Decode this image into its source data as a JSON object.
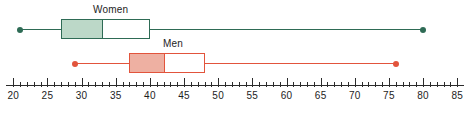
{
  "chart_data": {
    "type": "box",
    "title": "",
    "xlabel": "",
    "ylabel": "",
    "orientation": "horizontal",
    "xlim": [
      20,
      85
    ],
    "xticks": [
      20,
      25,
      30,
      35,
      40,
      45,
      50,
      55,
      60,
      65,
      70,
      75,
      80,
      85
    ],
    "xtick_labels": [
      "20",
      "25",
      "30",
      "35",
      "40",
      "45",
      "50",
      "55",
      "60",
      "65",
      "70",
      "75",
      "80",
      "85"
    ],
    "minor_tick_step": 1,
    "grid": false,
    "legend": "inline-labels",
    "series": [
      {
        "name": "Women",
        "label": "Women",
        "color": "#2e6b55",
        "fill": "#bcd8c8",
        "min": 21,
        "q1": 27,
        "median": 33,
        "q3": 40,
        "max": 80
      },
      {
        "name": "Men",
        "label": "Men",
        "color": "#e2543c",
        "fill": "#eeb0a2",
        "min": 29,
        "q1": 37,
        "median": 42,
        "q3": 48,
        "max": 76
      }
    ]
  },
  "geometry": {
    "axis": {
      "x_left_px": 6,
      "x_right_px": 464,
      "y_px": 85,
      "major_tick_len": 9,
      "minor_tick_len": 5
    },
    "scale": {
      "value_at_x0": 20,
      "x0_px": 13.3,
      "px_per_unit": 6.83
    },
    "rows": [
      {
        "name": "Women",
        "center_y": 29,
        "box_top": 19,
        "box_height": 20,
        "label_x": 93,
        "label_y": 4
      },
      {
        "name": "Men",
        "center_y": 63,
        "box_top": 53,
        "box_height": 20,
        "label_x": 163,
        "label_y": 38
      }
    ]
  }
}
